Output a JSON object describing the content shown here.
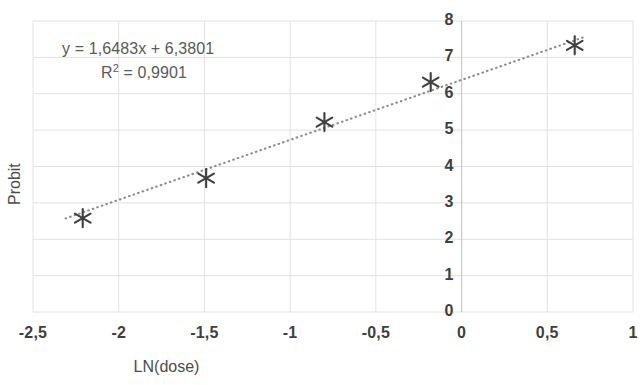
{
  "chart_data": {
    "type": "scatter",
    "title": "",
    "xlabel": "LN(dose)",
    "ylabel": "Probit",
    "xlim": [
      -2.5,
      1
    ],
    "ylim": [
      0,
      8
    ],
    "xticks": [
      "-2,5",
      "-2",
      "-1,5",
      "-1",
      "-0,5",
      "0",
      "0,5",
      "1"
    ],
    "xtick_values": [
      -2.5,
      -2,
      -1.5,
      -1,
      -0.5,
      0,
      0.5,
      1
    ],
    "yticks": [
      "0",
      "1",
      "2",
      "3",
      "4",
      "5",
      "6",
      "7",
      "8"
    ],
    "ytick_values": [
      0,
      1,
      2,
      3,
      4,
      5,
      6,
      7,
      8
    ],
    "grid": true,
    "legend": "none",
    "marker": "asterisk",
    "marker_color": "#3f3f3f",
    "trendline_color": "#8c8c8c",
    "trendline_style": "dotted",
    "gridline_color": "#e2e2e2",
    "points": [
      {
        "x": -2.21,
        "y": 2.58
      },
      {
        "x": -1.49,
        "y": 3.68
      },
      {
        "x": -0.8,
        "y": 5.22
      },
      {
        "x": -0.18,
        "y": 6.32
      },
      {
        "x": 0.66,
        "y": 7.33
      }
    ],
    "trendline": {
      "slope": 1.6483,
      "intercept": 6.3801,
      "r2": 0.9901,
      "x_start": -2.31,
      "x_end": 0.72
    },
    "annotations": {
      "equation": "y = 1,6483x + 6,3801",
      "r_squared_prefix": "R",
      "r_squared_exponent": "2",
      "r_squared_value": " = 0,9901"
    }
  }
}
